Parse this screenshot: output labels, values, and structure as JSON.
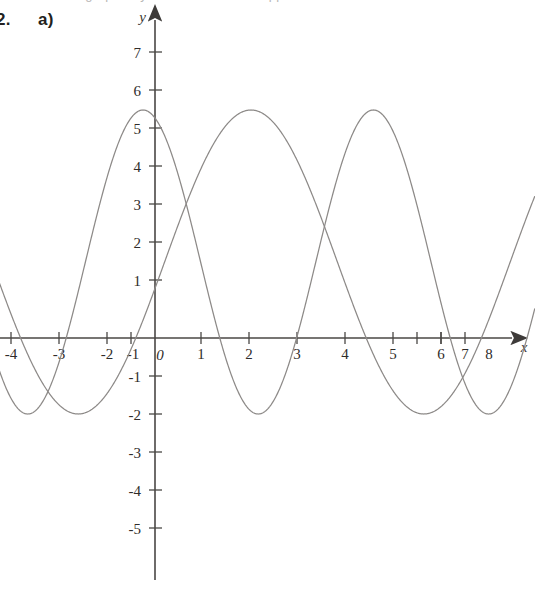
{
  "page": {
    "question_number": "2.",
    "part_label": "a)",
    "top_cutoff_text": "the graph of y = ... sinusoidal ... approximate"
  },
  "chart_data": {
    "type": "line",
    "title": "",
    "subtitle": "",
    "xlabel": "x",
    "ylabel": "y",
    "xlim": [
      -4.4,
      8.9
    ],
    "ylim": [
      -5.6,
      7.6
    ],
    "grid": false,
    "legend": "none",
    "x_ticks": [
      "-4",
      "-3",
      "-2",
      "-1",
      "0",
      "1",
      "2",
      "3",
      "4",
      "5",
      "6",
      "7",
      "8"
    ],
    "x_tick_values": [
      -4,
      -3,
      -2,
      -1,
      0,
      1,
      2,
      3,
      4,
      5,
      6,
      7,
      8
    ],
    "y_ticks": [
      "7",
      "6",
      "5",
      "4",
      "3",
      "2",
      "1",
      "-1",
      "-2",
      "-3",
      "-4",
      "-5"
    ],
    "y_tick_values": [
      7,
      6,
      5,
      4,
      3,
      2,
      1,
      -1,
      -2,
      -3,
      -4,
      -5
    ],
    "origin_label": "0",
    "axis_color": "#4a4745",
    "curve_color": "#8d8a88",
    "series": [
      {
        "name": "curve-1",
        "form": "sinusoid",
        "amplitude": 4,
        "midline": 2,
        "period": 4.8,
        "max_value": 6,
        "min_value": -2,
        "maxima_x": [
          -0.25,
          4.55
        ],
        "minima_x": [
          -2.65,
          2.15,
          6.95
        ],
        "zero_crossings_x": [
          -4.1,
          -1.15,
          0.65,
          3.65,
          5.45
        ],
        "phase_note": "maximum just left of the y-axis at x = -0.25"
      },
      {
        "name": "curve-2",
        "form": "sinusoid",
        "amplitude": 4,
        "midline": 2,
        "period": 7.2,
        "max_value": 6,
        "min_value": -2,
        "maxima_x": [
          2.0,
          9.2
        ],
        "minima_x": [
          -1.6,
          5.6
        ],
        "zero_crossings_x": [
          -3.0,
          -0.2,
          4.2,
          7.0
        ],
        "phase_note": "maximum at x = 2, minimum at x = 5.6"
      }
    ]
  }
}
